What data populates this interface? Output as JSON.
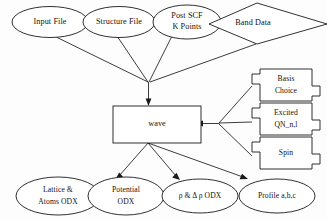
{
  "diagram": {
    "colors": {
      "background": "#fdfdfd",
      "stroke": "#1a1a1a",
      "fill": "#ffffff",
      "text": "#111111"
    },
    "inputs": [
      {
        "id": "input-file",
        "label": "Input File",
        "shape": "ellipse"
      },
      {
        "id": "structure-file",
        "label": "Structure File",
        "shape": "ellipse"
      },
      {
        "id": "post-scf",
        "label_line1": "Post SCF",
        "label_line2": "K Points",
        "shape": "ellipse"
      },
      {
        "id": "band-data",
        "label": "Band Data",
        "shape": "diamond"
      }
    ],
    "process": {
      "id": "wave",
      "label": "wave",
      "shape": "rectangle"
    },
    "options": [
      {
        "id": "basis-choice",
        "label_line1": "Basis",
        "label_line2": "Choice",
        "shape": "tabbed-box"
      },
      {
        "id": "excited-qn",
        "label_line1": "Excited",
        "label_line2": "QN_n,l",
        "shape": "tabbed-box"
      },
      {
        "id": "spin",
        "label": "Spin",
        "shape": "tabbed-box"
      }
    ],
    "outputs": [
      {
        "id": "lattice-atoms-odx",
        "label_line1": "Lattice &",
        "label_line2": "Atoms ODX",
        "shape": "ellipse"
      },
      {
        "id": "potential-odx",
        "label_line1": "Potential",
        "label_line2": "ODX",
        "shape": "ellipse"
      },
      {
        "id": "rho-odx",
        "label": "ρ & Δ ρ ODX",
        "shape": "ellipse"
      },
      {
        "id": "profile-abc",
        "label": "Profile a,b,c",
        "shape": "ellipse"
      }
    ]
  }
}
